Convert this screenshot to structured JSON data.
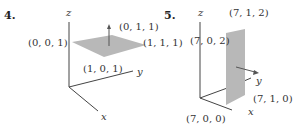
{
  "figures": [
    {
      "number": "4.",
      "axes": {
        "x": "x",
        "y": "y",
        "z": "z"
      },
      "points": [
        "(0, 0, 1)",
        "(0, 1, 1)",
        "(1, 1, 1)",
        "(1, 0, 1)"
      ],
      "description": "Horizontal square at z=1 with upward normal vector"
    },
    {
      "number": "5.",
      "axes": {
        "x": "x",
        "y": "y",
        "z": "z"
      },
      "points": [
        "(7, 1, 2)",
        "(7, 0, 2)",
        "(7, 1, 0)",
        "(7, 0, 0)"
      ],
      "description": "Vertical rectangle at x=7 with normal vector in y direction"
    }
  ],
  "colors": {
    "plane": "#b8b8b8",
    "axis": "#444444",
    "text": "#333333"
  }
}
